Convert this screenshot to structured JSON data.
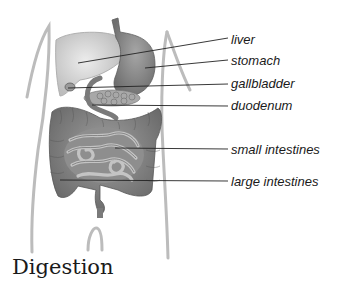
{
  "title": "Digestion",
  "labels": [
    {
      "id": "liver",
      "text": "liver",
      "x": 231,
      "y": 33,
      "from": [
        78,
        63
      ]
    },
    {
      "id": "stomach",
      "text": "stomach",
      "x": 231,
      "y": 54,
      "from": [
        145,
        68
      ]
    },
    {
      "id": "gallbladder",
      "text": "gallbladder",
      "x": 231,
      "y": 77,
      "from": [
        68,
        88
      ]
    },
    {
      "id": "duodenum",
      "text": "duodenum",
      "x": 231,
      "y": 99,
      "from": [
        92,
        105
      ]
    },
    {
      "id": "small-intestines",
      "text": "small intestines",
      "x": 231,
      "y": 143,
      "from": [
        115,
        148
      ]
    },
    {
      "id": "large-intestines",
      "text": "large intestines",
      "x": 231,
      "y": 175,
      "from": [
        60,
        180
      ]
    }
  ],
  "colors": {
    "organ_light": "#d4d4d4",
    "organ_mid": "#9a9a9a",
    "organ_dark": "#6e6e6e",
    "outline": "#b8b8b8",
    "leader": "#222222",
    "text": "#1a1a1a"
  }
}
